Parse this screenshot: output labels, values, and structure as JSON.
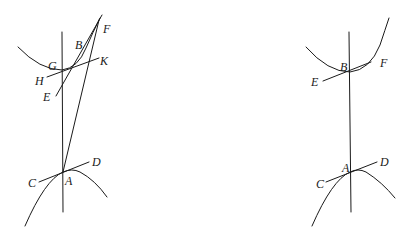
{
  "figures": [
    {
      "name": "left-figure",
      "labels": {
        "F": "F",
        "B": "B",
        "G": "G",
        "K": "K",
        "H": "H",
        "E": "E",
        "D": "D",
        "C": "C",
        "A": "A"
      }
    },
    {
      "name": "right-figure",
      "labels": {
        "B": "B",
        "F": "F",
        "E": "E",
        "A": "A",
        "D": "D",
        "C": "C"
      }
    }
  ],
  "colors": {
    "ink": "#1a1a1a",
    "background": "#ffffff"
  }
}
